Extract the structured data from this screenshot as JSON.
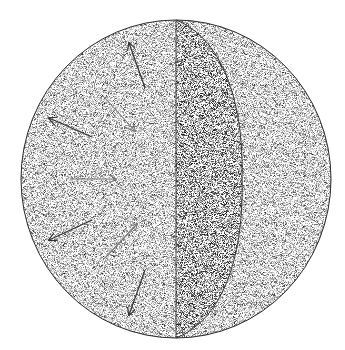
{
  "figure": {
    "background": "#ffffff",
    "sphere": {
      "cx": 176,
      "cy": 179,
      "rx": 155,
      "ry": 159
    },
    "cut_line_x": 176,
    "lens_bulge_x": 240,
    "colors": {
      "outline": "#2a2a2a",
      "dark_stipple": "#555555",
      "mid_stipple": "#9a9a9a",
      "light_stipple": "#d6d6d6",
      "arrow_dark": "#333333",
      "arrow_light": "#777777"
    },
    "arrows": [
      {
        "name": "arrow-outward-top",
        "x1": 145,
        "y1": 88,
        "x2": 129,
        "y2": 43,
        "shade": "dark"
      },
      {
        "name": "arrow-inward-upper",
        "x1": 104,
        "y1": 97,
        "x2": 135,
        "y2": 131,
        "shade": "light"
      },
      {
        "name": "arrow-outward-upper-left",
        "x1": 92,
        "y1": 137,
        "x2": 49,
        "y2": 118,
        "shade": "dark"
      },
      {
        "name": "arrow-inward-middle",
        "x1": 70,
        "y1": 179,
        "x2": 116,
        "y2": 179,
        "shade": "light"
      },
      {
        "name": "arrow-outward-lower-left",
        "x1": 92,
        "y1": 220,
        "x2": 49,
        "y2": 240,
        "shade": "dark"
      },
      {
        "name": "arrow-inward-lower",
        "x1": 105,
        "y1": 258,
        "x2": 137,
        "y2": 224,
        "shade": "light"
      },
      {
        "name": "arrow-outward-bottom",
        "x1": 145,
        "y1": 270,
        "x2": 129,
        "y2": 315,
        "shade": "dark"
      }
    ]
  }
}
